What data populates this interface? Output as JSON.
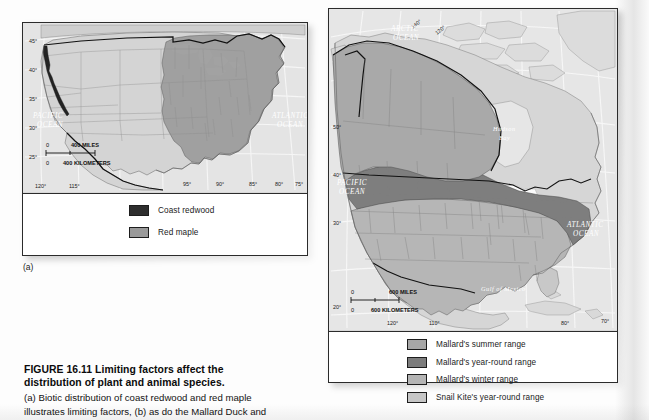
{
  "figure": {
    "number": "FIGURE 16.11",
    "title": "Limiting factors affect the distribution of plant and animal species.",
    "title_line1": "FIGURE 16.11  Limiting factors affect the",
    "title_line2": "distribution of plant and animal species.",
    "caption_line1": "(a) Biotic distribution of coast redwood and red maple",
    "caption_line2": "illustrates limiting factors, (b) as do the Mallard Duck and"
  },
  "panel_a": {
    "sublabel": "(a)",
    "map_title": "Coast redwood and red maple distribution in the United States",
    "latitude_labels": [
      "45°",
      "40°",
      "35°",
      "30°",
      "25°"
    ],
    "longitude_labels": [
      "120°",
      "115°",
      "95°",
      "90°",
      "85°",
      "80°",
      "75°"
    ],
    "ocean_labels": [
      "PACIFIC OCEAN",
      "ATLANTIC OCEAN"
    ],
    "pacific_line1": "PACIFIC",
    "pacific_line2": "OCEAN",
    "atlantic_line1": "ATLANTIC",
    "atlantic_line2": "OCEAN",
    "scale": {
      "miles_zero": "0",
      "miles_value": "400 MILES",
      "km_zero": "0",
      "km_value": "400 KILOMETERS"
    },
    "legend": [
      {
        "label": "Coast redwood",
        "color": "#2e2e2e"
      },
      {
        "label": "Red maple",
        "color": "#9a9a9a"
      }
    ]
  },
  "panel_b": {
    "map_title": "Mallard Duck and Snail Kite ranges in North America",
    "latitude_labels": [
      "50°",
      "40°",
      "30°",
      "20°"
    ],
    "longitude_labels": [
      "140°",
      "120°",
      "120°",
      "110°",
      "80°",
      "70°"
    ],
    "arctic_line1": "ARCTIC",
    "arctic_line2": "OCEAN",
    "pacific_line1": "PACIFIC",
    "pacific_line2": "OCEAN",
    "atlantic_line1": "ATLANTIC",
    "atlantic_line2": "OCEAN",
    "hudson_line1": "Hudson",
    "hudson_line2": "Bay",
    "gulf_label": "Gulf of Mexico",
    "scale": {
      "miles_zero": "0",
      "miles_value": "600 MILES",
      "km_zero": "0",
      "km_value": "600 KILOMETERS"
    },
    "legend": [
      {
        "label": "Mallard's summer range",
        "color": "#a7a7a7"
      },
      {
        "label": "Mallard's year-round range",
        "color": "#7c7c7c"
      },
      {
        "label": "Mallard's winter range",
        "color": "#b4b4b4"
      },
      {
        "label": "Snail Kite's year-round range",
        "color": "#c6c6c6"
      }
    ]
  },
  "colors": {
    "land": "#d6d6d6",
    "water": "#e9e9e9",
    "ink": "#1a1a1a",
    "border": "#2b2b2b",
    "page": "#fdfdfd"
  }
}
